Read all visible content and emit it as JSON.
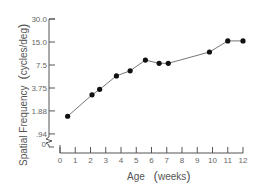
{
  "chart_data": {
    "type": "line",
    "title": "",
    "xlabel": "Age (weeks)",
    "xlabel_parts": {
      "main": "Age",
      "unit": "weeks"
    },
    "ylabel": "Spatial Frequency (cycles/deg)",
    "ylabel_parts": {
      "main": "Spatial Frequency",
      "unit": "cycles/deg"
    },
    "x_scale": "linear",
    "y_scale": "log2",
    "xlim": [
      0,
      12
    ],
    "ylim": [
      0.94,
      30.0
    ],
    "x_ticks": [
      0,
      1,
      2,
      3,
      4,
      5,
      6,
      7,
      8,
      9,
      10,
      11,
      12
    ],
    "x_tick_labels": [
      "0",
      "1",
      "2",
      "3",
      "4",
      "5",
      "6",
      "7",
      "8",
      "9",
      "10",
      "11",
      "12"
    ],
    "y_ticks": [
      0.94,
      1.88,
      3.75,
      7.5,
      15.0,
      30.0
    ],
    "y_tick_labels": [
      ".94",
      "1.88",
      "3.75",
      "7.5",
      "15.0",
      "30.0"
    ],
    "y_axis_break_label": "0",
    "grid": false,
    "legend": null,
    "series": [
      {
        "name": "Visual acuity",
        "marker": "filled-circle",
        "color": "#111111",
        "x": [
          0.5,
          2.1,
          2.6,
          3.7,
          4.6,
          5.6,
          6.5,
          7.1,
          9.8,
          11.0,
          12.0
        ],
        "values": [
          1.6,
          3.05,
          3.6,
          5.4,
          6.3,
          8.7,
          7.9,
          7.9,
          11.1,
          15.5,
          15.5
        ]
      }
    ]
  }
}
